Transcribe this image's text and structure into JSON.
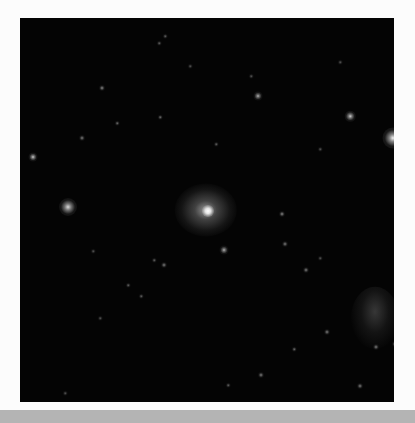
{
  "image": {
    "description": "Astronomical deep-sky image: dark star field with a bright fuzzy galaxy near center, a faint nebulous object in lower right, and a bright star at the right edge",
    "background": "#040404",
    "frame_background": "#fcfcfc",
    "bar_color": "#b4b4b4"
  },
  "stars": [
    {
      "x": 32,
      "y": 46,
      "r": 14,
      "b": 1.0,
      "kind": "galaxy"
    },
    {
      "x": 48,
      "y": 189,
      "r": 6,
      "b": 0.85
    },
    {
      "x": 373,
      "y": 120,
      "r": 7,
      "b": 0.95
    },
    {
      "x": 330,
      "y": 98,
      "r": 3.5,
      "b": 0.8
    },
    {
      "x": 238,
      "y": 78,
      "r": 3,
      "b": 0.7
    },
    {
      "x": 13,
      "y": 139,
      "r": 3,
      "b": 0.8
    },
    {
      "x": 62,
      "y": 120,
      "r": 2,
      "b": 0.5
    },
    {
      "x": 82,
      "y": 70,
      "r": 2,
      "b": 0.55
    },
    {
      "x": 262,
      "y": 196,
      "r": 2,
      "b": 0.55
    },
    {
      "x": 286,
      "y": 252,
      "r": 2,
      "b": 0.5
    },
    {
      "x": 265,
      "y": 226,
      "r": 2,
      "b": 0.5
    },
    {
      "x": 204,
      "y": 232,
      "r": 3,
      "b": 0.7
    },
    {
      "x": 144,
      "y": 247,
      "r": 2,
      "b": 0.5
    },
    {
      "x": 97,
      "y": 105,
      "r": 1.5,
      "b": 0.45
    },
    {
      "x": 145,
      "y": 18,
      "r": 1.5,
      "b": 0.4
    },
    {
      "x": 139,
      "y": 25,
      "r": 1.5,
      "b": 0.4
    },
    {
      "x": 140,
      "y": 99,
      "r": 1.5,
      "b": 0.45
    },
    {
      "x": 121,
      "y": 278,
      "r": 1.5,
      "b": 0.4
    },
    {
      "x": 108,
      "y": 267,
      "r": 1.5,
      "b": 0.4
    },
    {
      "x": 134,
      "y": 242,
      "r": 1.5,
      "b": 0.4
    },
    {
      "x": 307,
      "y": 314,
      "r": 2,
      "b": 0.5
    },
    {
      "x": 274,
      "y": 331,
      "r": 1.5,
      "b": 0.45
    },
    {
      "x": 241,
      "y": 357,
      "r": 2,
      "b": 0.5
    },
    {
      "x": 375,
      "y": 326,
      "r": 2,
      "b": 0.5
    },
    {
      "x": 356,
      "y": 329,
      "r": 2,
      "b": 0.5
    },
    {
      "x": 340,
      "y": 368,
      "r": 2,
      "b": 0.5
    },
    {
      "x": 196,
      "y": 126,
      "r": 1.5,
      "b": 0.4
    },
    {
      "x": 300,
      "y": 131,
      "r": 1.5,
      "b": 0.35
    },
    {
      "x": 231,
      "y": 58,
      "r": 1.5,
      "b": 0.35
    },
    {
      "x": 320,
      "y": 44,
      "r": 1.5,
      "b": 0.35
    },
    {
      "x": 170,
      "y": 48,
      "r": 1.5,
      "b": 0.35
    },
    {
      "x": 45,
      "y": 375,
      "r": 1.5,
      "b": 0.35
    },
    {
      "x": 208,
      "y": 367,
      "r": 1.5,
      "b": 0.4
    },
    {
      "x": 160,
      "y": 392,
      "r": 1.5,
      "b": 0.35
    },
    {
      "x": 73,
      "y": 233,
      "r": 1.5,
      "b": 0.35
    },
    {
      "x": 80,
      "y": 300,
      "r": 1.5,
      "b": 0.35
    },
    {
      "x": 300,
      "y": 240,
      "r": 1.5,
      "b": 0.35
    }
  ],
  "galaxy": {
    "x": 186,
    "y": 192,
    "rx": 26,
    "ry": 22,
    "core_r": 4
  },
  "nebula": {
    "x": 355,
    "y": 300,
    "rx": 20,
    "ry": 26
  },
  "edge_star": {
    "x": 372,
    "y": 120
  }
}
